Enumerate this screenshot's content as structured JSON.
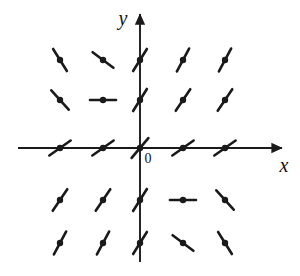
{
  "figure": {
    "kind": "slope-field",
    "title": "",
    "background_color": "#ffffff",
    "ink_color": "#1a1a1a"
  },
  "axes": {
    "x_axis": {
      "label": "x",
      "y_pixel": 148,
      "x_start": 18,
      "x_end": 282,
      "arrow": "right"
    },
    "y_axis": {
      "label": "y",
      "x_pixel": 140,
      "y_start": 262,
      "y_end": 14,
      "arrow": "up"
    },
    "origin": {
      "label": "0",
      "x_pixel": 140,
      "y_pixel": 148,
      "label_x": 148,
      "label_y": 163
    }
  },
  "chart_data": {
    "type": "scatter",
    "title": "",
    "xlabel": "x",
    "ylabel": "y",
    "grid": false,
    "legend": null,
    "xlim": [
      -2,
      2
    ],
    "ylim": [
      -2,
      2
    ],
    "columns_x_pixels": [
      60,
      103,
      140,
      183,
      225
    ],
    "rows_y_pixels": [
      60,
      100,
      148,
      200,
      243
    ],
    "x_ticks": [
      -2,
      -1,
      0,
      1,
      2
    ],
    "y_ticks": [
      2,
      1,
      0,
      -1,
      -2
    ],
    "segment_half_length": 13,
    "dot_radius": 3.2,
    "stroke_width": 2.6,
    "segments": [
      {
        "x": -2,
        "y": 2,
        "px": 60,
        "py": 60,
        "slope": -1.6,
        "angle_deg": -58
      },
      {
        "x": -1,
        "y": 2,
        "px": 103,
        "py": 60,
        "slope": -0.75,
        "angle_deg": -37
      },
      {
        "x": 0,
        "y": 2,
        "px": 140,
        "py": 60,
        "slope": 1.6,
        "angle_deg": 58
      },
      {
        "x": 1,
        "y": 2,
        "px": 183,
        "py": 60,
        "slope": 1.9,
        "angle_deg": 62
      },
      {
        "x": 2,
        "y": 2,
        "px": 225,
        "py": 60,
        "slope": 1.9,
        "angle_deg": 62
      },
      {
        "x": -2,
        "y": 1,
        "px": 60,
        "py": 100,
        "slope": -1.1,
        "angle_deg": -48
      },
      {
        "x": -1,
        "y": 1,
        "px": 103,
        "py": 100,
        "slope": 0.0,
        "angle_deg": 0
      },
      {
        "x": 0,
        "y": 1,
        "px": 140,
        "py": 100,
        "slope": 1.6,
        "angle_deg": 58
      },
      {
        "x": 1,
        "y": 1,
        "px": 183,
        "py": 100,
        "slope": 1.5,
        "angle_deg": 56
      },
      {
        "x": 2,
        "y": 1,
        "px": 225,
        "py": 100,
        "slope": 1.5,
        "angle_deg": 56
      },
      {
        "x": -2,
        "y": 0,
        "px": 60,
        "py": 148,
        "slope": 0.7,
        "angle_deg": 35
      },
      {
        "x": -1,
        "y": 0,
        "px": 103,
        "py": 148,
        "slope": 0.7,
        "angle_deg": 35
      },
      {
        "x": 0,
        "y": 0,
        "px": 140,
        "py": 148,
        "slope": 1.2,
        "angle_deg": 50
      },
      {
        "x": 1,
        "y": 0,
        "px": 183,
        "py": 148,
        "slope": 0.7,
        "angle_deg": 35
      },
      {
        "x": 2,
        "y": 0,
        "px": 225,
        "py": 148,
        "slope": 0.7,
        "angle_deg": 35
      },
      {
        "x": -2,
        "y": -1,
        "px": 60,
        "py": 200,
        "slope": 1.5,
        "angle_deg": 56
      },
      {
        "x": -1,
        "y": -1,
        "px": 103,
        "py": 200,
        "slope": 1.5,
        "angle_deg": 56
      },
      {
        "x": 0,
        "y": -1,
        "px": 140,
        "py": 200,
        "slope": 1.6,
        "angle_deg": 58
      },
      {
        "x": 1,
        "y": -1,
        "px": 183,
        "py": 200,
        "slope": 0.0,
        "angle_deg": 0
      },
      {
        "x": 2,
        "y": -1,
        "px": 225,
        "py": 200,
        "slope": -1.1,
        "angle_deg": -48
      },
      {
        "x": -2,
        "y": -2,
        "px": 60,
        "py": 243,
        "slope": 1.9,
        "angle_deg": 62
      },
      {
        "x": -1,
        "y": -2,
        "px": 103,
        "py": 243,
        "slope": 1.9,
        "angle_deg": 62
      },
      {
        "x": 0,
        "y": -2,
        "px": 140,
        "py": 243,
        "slope": 1.6,
        "angle_deg": 58
      },
      {
        "x": 1,
        "y": -2,
        "px": 183,
        "py": 243,
        "slope": -0.75,
        "angle_deg": -37
      },
      {
        "x": 2,
        "y": -2,
        "px": 225,
        "py": 243,
        "slope": -1.6,
        "angle_deg": -58
      }
    ]
  }
}
